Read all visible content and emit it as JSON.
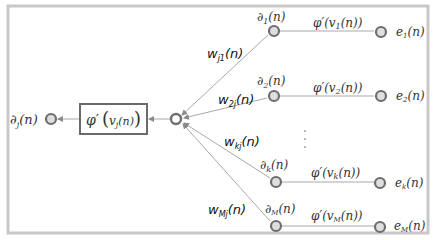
{
  "diagram": {
    "type": "backpropagation-local-gradient",
    "colors": {
      "frame": "#c9c9c9",
      "edge": "#a9a9a9",
      "node_fill": "#dedede",
      "node_stroke": "#6e6e6e",
      "text": "#333333"
    },
    "output": {
      "label_main": "∂",
      "label_sub": "j",
      "label_arg": "(n)"
    },
    "activation_box": {
      "label_phi": "φ′",
      "label_v": "v",
      "label_sub": "j",
      "label_arg": "(n)"
    },
    "weights": [
      {
        "main": "w",
        "sub": "j1",
        "arg": "(n)"
      },
      {
        "main": "w",
        "sub": "2j",
        "arg": "(n)"
      },
      {
        "main": "w",
        "sub": "kj",
        "arg": "(n)"
      },
      {
        "main": "w",
        "sub": "Mj",
        "arg": "(n)"
      }
    ],
    "branches": [
      {
        "delta_main": "∂",
        "delta_sub": "1",
        "delta_arg": "(n)",
        "phi": "φ′(v",
        "phi_sub": "1",
        "phi_arg": "(n))",
        "error_main": "e",
        "error_sub": "1",
        "error_arg": "(n)"
      },
      {
        "delta_main": "∂",
        "delta_sub": "2",
        "delta_arg": "(n)",
        "phi": "φ′(v",
        "phi_sub": "2",
        "phi_arg": "(n))",
        "error_main": "e",
        "error_sub": "2",
        "error_arg": "(n)"
      },
      {
        "delta_main": "∂",
        "delta_sub": "k",
        "delta_arg": "(n)",
        "phi": "φ′(v",
        "phi_sub": "k",
        "phi_arg": "(n))",
        "error_main": "e",
        "error_sub": "k",
        "error_arg": "(n)"
      },
      {
        "delta_main": "∂",
        "delta_sub": "M",
        "delta_arg": "(n)",
        "phi": "φ′(v",
        "phi_sub": "M",
        "phi_arg": "(n))",
        "error_main": "e",
        "error_sub": "M",
        "error_arg": "(n)"
      }
    ],
    "ellipsis": "⋮"
  }
}
